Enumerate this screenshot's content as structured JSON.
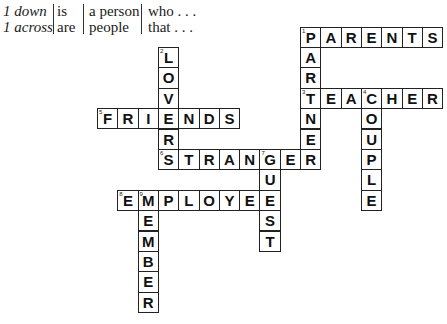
{
  "header": {
    "col1": [
      "1 down",
      "1 across"
    ],
    "col2": [
      "is",
      "are"
    ],
    "col3": [
      "a person",
      "people"
    ],
    "col4": [
      "who . . .",
      "that . . ."
    ]
  },
  "grid": {
    "origin_x": 300,
    "origin_y": 26.5,
    "pitch_x": 20.3,
    "pitch_y": 20.4
  },
  "words": [
    {
      "number": 1,
      "direction": "across",
      "answer": "PARENTS",
      "row": 0,
      "col": 0
    },
    {
      "number": 1,
      "direction": "down",
      "answer": "PARTNER",
      "row": 0,
      "col": 0
    },
    {
      "number": 2,
      "direction": "down",
      "answer": "LOVERS",
      "row": 1,
      "col": -7
    },
    {
      "number": 3,
      "direction": "across",
      "answer": "TEACHER",
      "row": 3,
      "col": 0
    },
    {
      "number": 4,
      "direction": "down",
      "answer": "COUPLE",
      "row": 3,
      "col": 3
    },
    {
      "number": 5,
      "direction": "across",
      "answer": "FRIENDS",
      "row": 4,
      "col": -10
    },
    {
      "number": 6,
      "direction": "across",
      "answer": "STRANGER",
      "row": 6,
      "col": -7
    },
    {
      "number": 7,
      "direction": "down",
      "answer": "GUEST",
      "row": 6,
      "col": -2
    },
    {
      "number": 8,
      "direction": "across",
      "answer": "EMPLOYEE",
      "row": 8,
      "col": -9
    },
    {
      "number": 9,
      "direction": "down",
      "answer": "MEMBER",
      "row": 8,
      "col": -8
    }
  ]
}
